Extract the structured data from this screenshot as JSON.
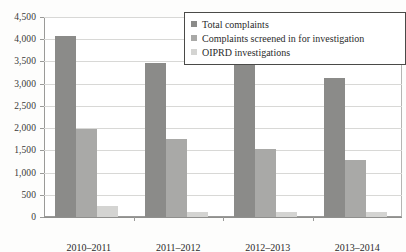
{
  "chart_data": {
    "type": "bar",
    "title": "",
    "subtitle": "",
    "xlabel": "",
    "ylabel": "",
    "ylim": [
      0,
      4500
    ],
    "ytick_labels": [
      "4,500",
      "4,000",
      "3,500",
      "3,000",
      "2,500",
      "2,000",
      "1,500",
      "1,000",
      "500",
      "0"
    ],
    "ytick_values": [
      4500,
      4000,
      3500,
      3000,
      2500,
      2000,
      1500,
      1000,
      500,
      0
    ],
    "grid": true,
    "legend_position": "top-right",
    "categories": [
      "2010–2011",
      "2011–2012",
      "2012–2013",
      "2013–2014"
    ],
    "series": [
      {
        "name": "Total complaints",
        "color": "#8b8b89",
        "values": [
          4080,
          3470,
          3440,
          3120
        ]
      },
      {
        "name": "Complaints screened in for investigation",
        "color": "#a9a9a7",
        "values": [
          1980,
          1760,
          1540,
          1290
        ]
      },
      {
        "name": "OIPRD investigations",
        "color": "#d4d4d2",
        "values": [
          250,
          120,
          120,
          120
        ]
      }
    ]
  },
  "legend": {
    "items": [
      {
        "label": "Total complaints",
        "swatch": "legend-swatch-total-complaints"
      },
      {
        "label": "Complaints screened in for investigation",
        "swatch": "legend-swatch-screened-in"
      },
      {
        "label": "OIPRD investigations",
        "swatch": "legend-swatch-oiprd-investigations"
      }
    ]
  }
}
